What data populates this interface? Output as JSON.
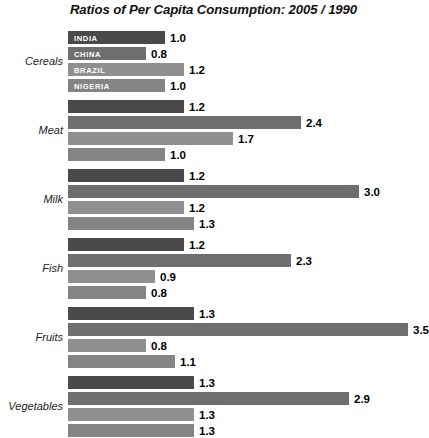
{
  "chart_data": {
    "type": "bar",
    "orientation": "horizontal",
    "title": "Ratios of Per Capita Consumption: 2005 / 1990",
    "xlabel": "",
    "ylabel": "",
    "xlim": [
      0,
      3.7
    ],
    "grid": false,
    "legend_position": "in-bar-labels-first-group",
    "categories": [
      "Cereals",
      "Meat",
      "Milk",
      "Fish",
      "Fruits",
      "Vegetables"
    ],
    "series": [
      {
        "name": "INDIA",
        "color": "#4a4a4a",
        "values": [
          1.0,
          1.2,
          1.2,
          1.2,
          1.3,
          1.3
        ]
      },
      {
        "name": "CHINA",
        "color": "#6e6e6e",
        "values": [
          0.8,
          2.4,
          3.0,
          2.3,
          3.5,
          2.9
        ]
      },
      {
        "name": "BRAZIL",
        "color": "#909090",
        "values": [
          1.2,
          1.7,
          1.2,
          0.9,
          0.8,
          1.3
        ]
      },
      {
        "name": "NIGERIA",
        "color": "#848484",
        "values": [
          1.0,
          1.0,
          1.3,
          0.8,
          1.1,
          1.3
        ]
      }
    ],
    "value_labels": [
      [
        "1.0",
        "0.8",
        "1.2",
        "1.0"
      ],
      [
        "1.2",
        "2.4",
        "1.7",
        "1.0"
      ],
      [
        "1.2",
        "3.0",
        "1.2",
        "1.3"
      ],
      [
        "1.2",
        "2.3",
        "0.9",
        "0.8"
      ],
      [
        "1.3",
        "3.5",
        "0.8",
        "1.1"
      ],
      [
        "1.3",
        "2.9",
        "1.3",
        "1.3"
      ]
    ],
    "country_labels_shown_in_group": 0,
    "px_per_unit": 97,
    "bar_origin_x": 68
  }
}
